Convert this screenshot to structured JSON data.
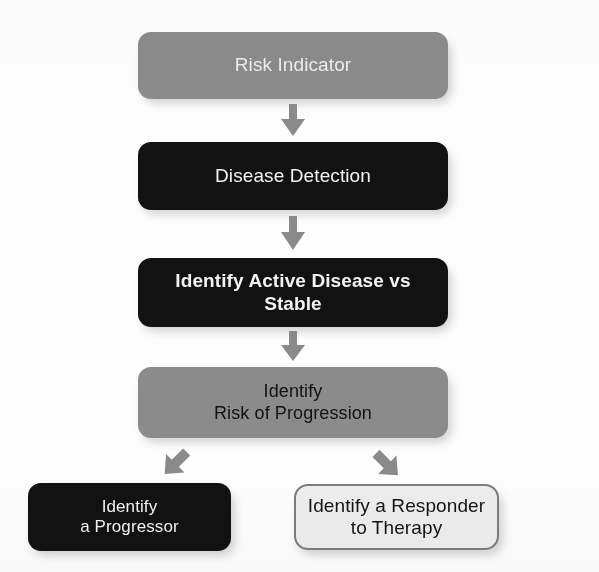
{
  "diagram": {
    "background_color": "#fdfdfd",
    "nodes": [
      {
        "id": "risk-indicator",
        "label": "Risk Indicator",
        "lines": [
          "Risk Indicator"
        ],
        "style": "gray",
        "fill_color": "#8b8b8b",
        "text_color": "#ededed",
        "bold": false,
        "font_size_px": 19,
        "x": 138,
        "y": 32,
        "w": 310,
        "h": 67
      },
      {
        "id": "disease-detection",
        "label": "Disease Detection",
        "lines": [
          "Disease Detection"
        ],
        "style": "dark",
        "fill_color": "#121212",
        "text_color": "#f2f2f2",
        "bold": false,
        "font_size_px": 19,
        "x": 138,
        "y": 142,
        "w": 310,
        "h": 68
      },
      {
        "id": "identify-active-disease-vs-stable",
        "label": "Identify Active Disease vs Stable",
        "lines": [
          "Identify Active Disease vs",
          "Stable"
        ],
        "style": "dark",
        "fill_color": "#121212",
        "text_color": "#f2f2f2",
        "bold": true,
        "font_size_px": 19,
        "x": 138,
        "y": 258,
        "w": 310,
        "h": 69
      },
      {
        "id": "identify-risk-of-progression",
        "label": "Identify Risk of Progression",
        "lines": [
          "Identify",
          "Risk of Progression"
        ],
        "style": "gray-dark-text",
        "fill_color": "#8b8b8b",
        "text_color": "#121212",
        "bold": false,
        "font_size_px": 18,
        "x": 138,
        "y": 367,
        "w": 310,
        "h": 71
      },
      {
        "id": "identify-a-progressor",
        "label": "Identify a Progressor",
        "lines": [
          "Identify",
          "a Progressor"
        ],
        "style": "dark",
        "fill_color": "#121212",
        "text_color": "#f2f2f2",
        "bold": false,
        "font_size_px": 17,
        "x": 28,
        "y": 483,
        "w": 203,
        "h": 68
      },
      {
        "id": "identify-a-responder-to-therapy",
        "label": "Identify a Responder to Therapy",
        "lines": [
          "Identify a Responder",
          "to Therapy"
        ],
        "style": "light",
        "fill_color": "#ededed",
        "text_color": "#141414",
        "border_color": "#7d7d7d",
        "bold": false,
        "font_size_px": 19,
        "x": 294,
        "y": 484,
        "w": 205,
        "h": 66
      }
    ],
    "connectors": [
      {
        "id": "arrow-risk-to-detection",
        "from": "risk-indicator",
        "to": "disease-detection",
        "direction": "down",
        "color": "#8a8a8a",
        "x": 279,
        "y": 104,
        "w": 28,
        "h": 34
      },
      {
        "id": "arrow-detection-to-active",
        "from": "disease-detection",
        "to": "identify-active-disease-vs-stable",
        "direction": "down",
        "color": "#8a8a8a",
        "x": 279,
        "y": 216,
        "w": 28,
        "h": 36
      },
      {
        "id": "arrow-active-to-progression",
        "from": "identify-active-disease-vs-stable",
        "to": "identify-risk-of-progression",
        "direction": "down",
        "color": "#8a8a8a",
        "x": 279,
        "y": 331,
        "w": 28,
        "h": 32
      },
      {
        "id": "arrow-progression-to-progressor",
        "from": "identify-risk-of-progression",
        "to": "identify-a-progressor",
        "direction": "down-left",
        "color": "#8a8a8a",
        "x": 158,
        "y": 446,
        "w": 36,
        "h": 36
      },
      {
        "id": "arrow-progression-to-responder",
        "from": "identify-risk-of-progression",
        "to": "identify-a-responder-to-therapy",
        "direction": "down-right",
        "color": "#8a8a8a",
        "x": 370,
        "y": 446,
        "w": 36,
        "h": 36
      }
    ]
  }
}
